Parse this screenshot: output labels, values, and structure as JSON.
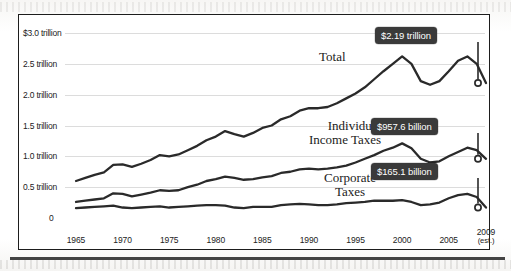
{
  "chart_data": {
    "type": "line",
    "title": "",
    "xlabel": "",
    "ylabel": "",
    "ylim": [
      0,
      3.0
    ],
    "xlim": [
      1965,
      2009
    ],
    "grid": true,
    "legend_position": "inline-labels",
    "y_unit": "trillions of dollars",
    "y_ticks": [
      {
        "value": 3.0,
        "label": "$3.0 trillion"
      },
      {
        "value": 2.5,
        "label": "2.5 trillion"
      },
      {
        "value": 2.0,
        "label": "2.0 trillion"
      },
      {
        "value": 1.5,
        "label": "1.5 trillion"
      },
      {
        "value": 1.0,
        "label": "1.0 trillion"
      },
      {
        "value": 0.5,
        "label": "0.5 trillion"
      },
      {
        "value": 0.0,
        "label": "0"
      }
    ],
    "x_ticks": [
      {
        "value": 1965,
        "label": "1965",
        "sub": ""
      },
      {
        "value": 1970,
        "label": "1970",
        "sub": ""
      },
      {
        "value": 1975,
        "label": "1975",
        "sub": ""
      },
      {
        "value": 1980,
        "label": "1980",
        "sub": ""
      },
      {
        "value": 1985,
        "label": "1985",
        "sub": ""
      },
      {
        "value": 1990,
        "label": "1990",
        "sub": ""
      },
      {
        "value": 1995,
        "label": "1995",
        "sub": ""
      },
      {
        "value": 2000,
        "label": "2000",
        "sub": ""
      },
      {
        "value": 2005,
        "label": "2005",
        "sub": ""
      },
      {
        "value": 2009,
        "label": "2009",
        "sub": "(est.)"
      }
    ],
    "x": [
      1965,
      1966,
      1967,
      1968,
      1969,
      1970,
      1971,
      1972,
      1973,
      1974,
      1975,
      1976,
      1977,
      1978,
      1979,
      1980,
      1981,
      1982,
      1983,
      1984,
      1985,
      1986,
      1987,
      1988,
      1989,
      1990,
      1991,
      1992,
      1993,
      1994,
      1995,
      1996,
      1997,
      1998,
      1999,
      2000,
      2001,
      2002,
      2003,
      2004,
      2005,
      2006,
      2007,
      2008,
      2009
    ],
    "series": [
      {
        "name": "Total",
        "label": "Total",
        "end_value_label": "$2.19 trillion",
        "end_value": 2.19,
        "values": [
          0.6,
          0.65,
          0.7,
          0.74,
          0.86,
          0.87,
          0.83,
          0.88,
          0.94,
          1.02,
          1.0,
          1.03,
          1.1,
          1.17,
          1.26,
          1.32,
          1.41,
          1.36,
          1.32,
          1.38,
          1.46,
          1.5,
          1.6,
          1.65,
          1.74,
          1.78,
          1.78,
          1.8,
          1.86,
          1.94,
          2.02,
          2.12,
          2.25,
          2.38,
          2.5,
          2.62,
          2.5,
          2.22,
          2.16,
          2.22,
          2.38,
          2.55,
          2.62,
          2.5,
          2.19
        ]
      },
      {
        "name": "Individual Income Taxes",
        "label_line1": "Individual",
        "label_line2": "Income Taxes",
        "end_value_label": "$957.6 billion",
        "end_value": 0.9576,
        "values": [
          0.26,
          0.28,
          0.3,
          0.32,
          0.4,
          0.39,
          0.35,
          0.38,
          0.41,
          0.45,
          0.44,
          0.45,
          0.5,
          0.54,
          0.6,
          0.63,
          0.67,
          0.65,
          0.62,
          0.63,
          0.66,
          0.68,
          0.73,
          0.75,
          0.79,
          0.8,
          0.79,
          0.8,
          0.82,
          0.85,
          0.9,
          0.96,
          1.02,
          1.09,
          1.14,
          1.21,
          1.13,
          0.96,
          0.9,
          0.92,
          1.0,
          1.07,
          1.14,
          1.1,
          0.96
        ]
      },
      {
        "name": "Corporate Taxes",
        "label_line1": "Corporate",
        "label_line2": "Taxes",
        "end_value_label": "$165.1 billion",
        "end_value": 0.1651,
        "values": [
          0.16,
          0.17,
          0.18,
          0.19,
          0.2,
          0.17,
          0.16,
          0.17,
          0.18,
          0.19,
          0.17,
          0.18,
          0.19,
          0.2,
          0.21,
          0.21,
          0.2,
          0.17,
          0.16,
          0.18,
          0.18,
          0.18,
          0.21,
          0.22,
          0.23,
          0.22,
          0.21,
          0.21,
          0.22,
          0.24,
          0.25,
          0.26,
          0.28,
          0.28,
          0.28,
          0.29,
          0.26,
          0.21,
          0.22,
          0.25,
          0.32,
          0.37,
          0.39,
          0.34,
          0.17
        ]
      }
    ]
  },
  "callouts": [
    {
      "id": "total",
      "text": "$2.19 trillion"
    },
    {
      "id": "individual",
      "text": "$957.6 billion"
    },
    {
      "id": "corporate",
      "text": "$165.1 billion"
    }
  ],
  "colors": {
    "line": "#2a2a2a",
    "frame": "#1d1d1d",
    "badge_bg": "#3a3a3a",
    "badge_text": "#ffffff",
    "grid": "#8c8c8c",
    "paper": "#fdfdfc"
  }
}
